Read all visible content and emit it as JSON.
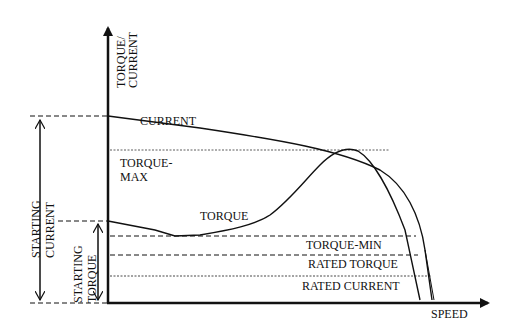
{
  "axes": {
    "y_label_line1": "TORQUE/",
    "y_label_line2": "CURRENT",
    "x_label": "SPEED"
  },
  "curves": {
    "current_label": "CURRENT",
    "torque_label": "TORQUE"
  },
  "levels": {
    "torque_max_line1": "TORQUE-",
    "torque_max_line2": "MAX",
    "torque_min": "TORQUE-MIN",
    "rated_torque": "RATED TORQUE",
    "rated_current": "RATED CURRENT"
  },
  "dimensions": {
    "starting_current_line1": "STARTING",
    "starting_current_line2": "CURRENT",
    "starting_torque_line1": "STARTING",
    "starting_torque_line2": "TORQUE"
  },
  "colors": {
    "ink": "#111111",
    "background": "#ffffff"
  }
}
